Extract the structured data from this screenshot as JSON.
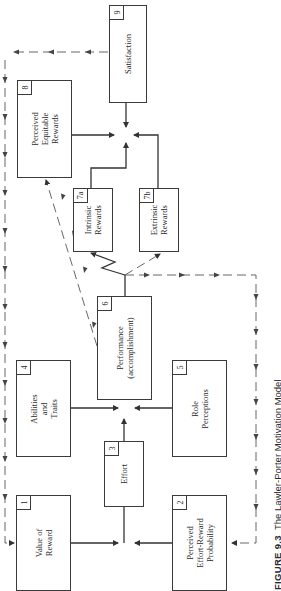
{
  "diagram": {
    "caption": {
      "figure": "FIGURE 9.3",
      "title": "The Lawler-Porter Motivation Model"
    },
    "nodes": [
      {
        "id": "1",
        "number": "1",
        "label": "Value of\nReward"
      },
      {
        "id": "2",
        "number": "2",
        "label": "Perceived\nEffort-Reward\nProbability"
      },
      {
        "id": "3",
        "number": "3",
        "label": "Effort"
      },
      {
        "id": "4",
        "number": "4",
        "label": "Abilities\nand\nTraits"
      },
      {
        "id": "5",
        "number": "5",
        "label": "Role\nPerceptions"
      },
      {
        "id": "6",
        "number": "6",
        "label": "Performance\n(accomplishment)"
      },
      {
        "id": "7a",
        "number": "7a",
        "label": "Intrinsic\nRewards"
      },
      {
        "id": "7b",
        "number": "7b",
        "label": "Extrinsic\nRewards"
      },
      {
        "id": "8",
        "number": "8",
        "label": "Perceived\nEquitable\nRewards"
      },
      {
        "id": "9",
        "number": "9",
        "label": "Satisfaction"
      }
    ],
    "edges": [
      {
        "from": "1",
        "to": "3",
        "style": "solid"
      },
      {
        "from": "2",
        "to": "3",
        "style": "solid"
      },
      {
        "from": "3",
        "to": "6",
        "style": "solid"
      },
      {
        "from": "4",
        "to": "6",
        "style": "solid"
      },
      {
        "from": "5",
        "to": "6",
        "style": "solid"
      },
      {
        "from": "6",
        "to": "7a",
        "style": "zigzag"
      },
      {
        "from": "6",
        "to": "7b",
        "style": "dashed"
      },
      {
        "from": "6",
        "to": "8",
        "style": "dashed"
      },
      {
        "from": "7a",
        "to": "9",
        "style": "solid"
      },
      {
        "from": "7b",
        "to": "9",
        "style": "solid"
      },
      {
        "from": "8",
        "to": "9",
        "style": "solid"
      },
      {
        "from": "9",
        "to": "1",
        "style": "dashed-feedback"
      },
      {
        "from": "6",
        "to": "2",
        "style": "dashed-feedback"
      }
    ],
    "colors": {
      "line": "#3a3a3a",
      "background": "#ffffff"
    },
    "orientation": "rotated 90° counter-clockwise"
  }
}
